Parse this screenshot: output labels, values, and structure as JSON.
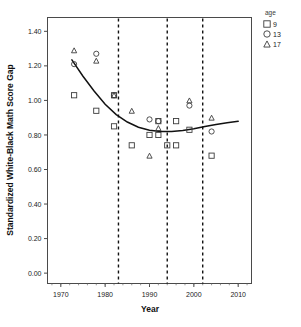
{
  "chart_data": {
    "type": "scatter",
    "title": "",
    "xlabel": "Year",
    "ylabel": "Standardized White-Black Math Score Gap",
    "xlim": [
      1967,
      2013
    ],
    "ylim": [
      -0.06,
      1.48
    ],
    "xticks": [
      1970,
      1980,
      1990,
      2000,
      2010
    ],
    "xtick_labels": [
      "1970",
      "1980",
      "1990",
      "2000",
      "2010"
    ],
    "yticks": [
      0.0,
      0.2,
      0.4,
      0.6,
      0.8,
      1.0,
      1.2,
      1.4
    ],
    "ytick_labels": [
      "0.00",
      "0.20",
      "0.40",
      "0.60",
      "0.80",
      "1.00",
      "1.20",
      "1.40"
    ],
    "grid": false,
    "legend": {
      "title": "age",
      "position": "top-right-outside",
      "entries": [
        {
          "label": "9",
          "marker": "square"
        },
        {
          "label": "13",
          "marker": "circle"
        },
        {
          "label": "17",
          "marker": "triangle"
        }
      ]
    },
    "annotations": {
      "vertical_dashed_lines": [
        1983,
        1994,
        2002
      ]
    },
    "series": [
      {
        "name": "9",
        "marker": "square",
        "points": [
          {
            "x": 1973,
            "y": 1.03
          },
          {
            "x": 1978,
            "y": 0.94
          },
          {
            "x": 1982,
            "y": 1.03
          },
          {
            "x": 1982,
            "y": 0.85
          },
          {
            "x": 1986,
            "y": 0.74
          },
          {
            "x": 1990,
            "y": 0.8
          },
          {
            "x": 1992,
            "y": 0.8
          },
          {
            "x": 1992,
            "y": 0.88
          },
          {
            "x": 1994,
            "y": 0.74
          },
          {
            "x": 1996,
            "y": 0.74
          },
          {
            "x": 1996,
            "y": 0.88
          },
          {
            "x": 1999,
            "y": 0.83
          },
          {
            "x": 2004,
            "y": 0.68
          }
        ]
      },
      {
        "name": "13",
        "marker": "circle",
        "points": [
          {
            "x": 1973,
            "y": 1.21
          },
          {
            "x": 1978,
            "y": 1.27
          },
          {
            "x": 1982,
            "y": 1.03
          },
          {
            "x": 1990,
            "y": 0.89
          },
          {
            "x": 1992,
            "y": 0.88
          },
          {
            "x": 1999,
            "y": 0.97
          },
          {
            "x": 2004,
            "y": 0.82
          }
        ]
      },
      {
        "name": "17",
        "marker": "triangle",
        "points": [
          {
            "x": 1973,
            "y": 1.29
          },
          {
            "x": 1978,
            "y": 1.23
          },
          {
            "x": 1982,
            "y": 1.03
          },
          {
            "x": 1986,
            "y": 0.94
          },
          {
            "x": 1990,
            "y": 0.68
          },
          {
            "x": 1992,
            "y": 0.84
          },
          {
            "x": 1999,
            "y": 1.0
          },
          {
            "x": 2004,
            "y": 0.9
          }
        ]
      }
    ],
    "fit_curve": {
      "name": "quadratic-fit",
      "points": [
        {
          "x": 1972.5,
          "y": 1.235
        },
        {
          "x": 1975,
          "y": 1.14
        },
        {
          "x": 1977.5,
          "y": 1.055
        },
        {
          "x": 1980,
          "y": 0.978
        },
        {
          "x": 1982.5,
          "y": 0.918
        },
        {
          "x": 1985,
          "y": 0.875
        },
        {
          "x": 1987.5,
          "y": 0.845
        },
        {
          "x": 1990,
          "y": 0.827
        },
        {
          "x": 1992.5,
          "y": 0.82
        },
        {
          "x": 1995,
          "y": 0.82
        },
        {
          "x": 1997.5,
          "y": 0.826
        },
        {
          "x": 2000,
          "y": 0.836
        },
        {
          "x": 2002.5,
          "y": 0.849
        },
        {
          "x": 2005,
          "y": 0.86
        },
        {
          "x": 2007.5,
          "y": 0.871
        },
        {
          "x": 2010,
          "y": 0.879
        }
      ]
    }
  }
}
